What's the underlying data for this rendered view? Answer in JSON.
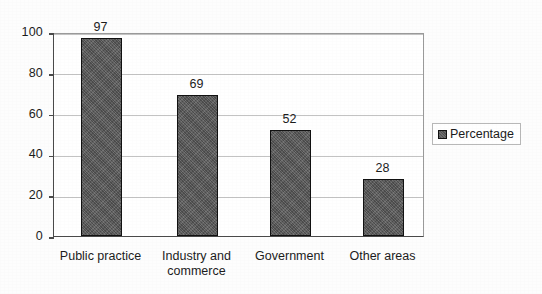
{
  "chart_data": {
    "type": "bar",
    "title": "",
    "subtitle": "",
    "xlabel": "",
    "ylabel": "",
    "categories": [
      "Public practice",
      "Industry and\ncommerce",
      "Government",
      "Other areas"
    ],
    "values": [
      97,
      69,
      52,
      28
    ],
    "series": [
      {
        "name": "Percentage",
        "values": [
          97,
          69,
          52,
          28
        ]
      }
    ],
    "ylim": [
      0,
      100
    ],
    "yticks": [
      0,
      20,
      40,
      60,
      80,
      100
    ],
    "ytick_labels": [
      "0",
      "20",
      "40",
      "60",
      "80",
      "100"
    ],
    "grid": true,
    "grid_axis": "y",
    "legend": {
      "position": "right",
      "entries": [
        {
          "label": "Percentage",
          "color": "#5a5a5a"
        }
      ]
    },
    "data_labels": [
      "97",
      "69",
      "52",
      "28"
    ],
    "colors": {
      "bar_fill": "#5a5a5a",
      "bar_border": "#111111",
      "gridline": "#c3c3c3",
      "axis": "#4a4a4a",
      "text": "#1c1c1c",
      "background": "#ffffff"
    }
  }
}
